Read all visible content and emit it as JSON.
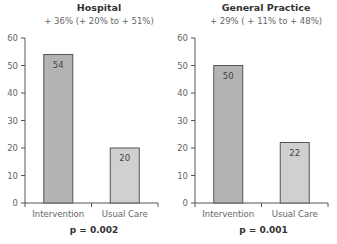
{
  "chart_data": [
    {
      "type": "bar",
      "title": "Hospital",
      "subtitle": "+ 36% (+ 20% to + 51%)",
      "categories": [
        "Intervention",
        "Usual Care"
      ],
      "values": [
        54,
        20
      ],
      "data_labels": [
        "54",
        "20"
      ],
      "xlabel": "",
      "ylabel": "",
      "ylim": [
        0,
        60
      ],
      "yticks": [
        0,
        10,
        20,
        30,
        40,
        50,
        60
      ],
      "annotation": "p = 0.002",
      "bar_colors": [
        "#b3b3b3",
        "#d0d0d0"
      ],
      "grid": false,
      "legend": null
    },
    {
      "type": "bar",
      "title": "General Practice",
      "subtitle": "+ 29% ( + 11% to + 48%)",
      "categories": [
        "Intervention",
        "Usual Care"
      ],
      "values": [
        50,
        22
      ],
      "data_labels": [
        "50",
        "22"
      ],
      "xlabel": "",
      "ylabel": "",
      "ylim": [
        0,
        60
      ],
      "yticks": [
        0,
        10,
        20,
        30,
        40,
        50,
        60
      ],
      "annotation": "p = 0.001",
      "bar_colors": [
        "#b3b3b3",
        "#d0d0d0"
      ],
      "grid": false,
      "legend": null
    }
  ],
  "panels": [
    {
      "title": "Hospital",
      "subtitle": "+ 36% (+ 20% to + 51%)",
      "pvalue": "p = 0.002"
    },
    {
      "title": "General Practice",
      "subtitle": "+ 29% ( + 11% to + 48%)",
      "pvalue": "p = 0.001"
    }
  ]
}
